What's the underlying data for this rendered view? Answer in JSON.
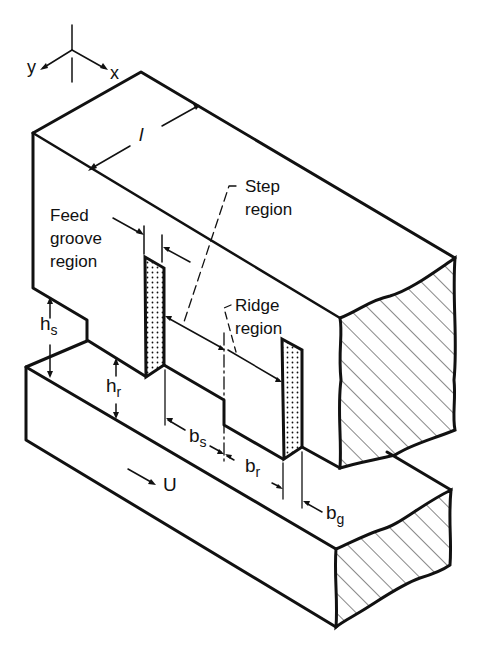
{
  "figure": {
    "type": "isometric bearing geometry diagram",
    "axes": {
      "x_label": "x",
      "y_label": "y"
    },
    "labels": {
      "feed_groove": [
        "Feed",
        "groove",
        "region"
      ],
      "step": [
        "Step",
        "region"
      ],
      "ridge": [
        "Ridge",
        "region"
      ]
    },
    "dimensions": {
      "length": "l",
      "h_s": {
        "base": "h",
        "sub": "s"
      },
      "h_r": {
        "base": "h",
        "sub": "r"
      },
      "b_s": {
        "base": "b",
        "sub": "s"
      },
      "b_r": {
        "base": "b",
        "sub": "r"
      },
      "b_g": {
        "base": "b",
        "sub": "g"
      }
    },
    "velocity": {
      "arrow": "→",
      "label": "U"
    },
    "colors": {
      "ink": "#111111",
      "background": "#ffffff"
    }
  }
}
